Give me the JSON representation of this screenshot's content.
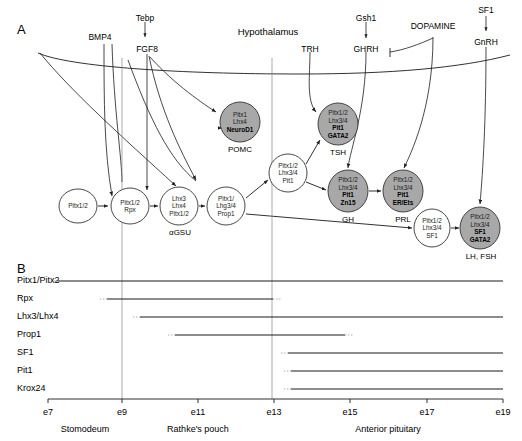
{
  "figure": {
    "panels": [
      {
        "id": "A",
        "letter": "A"
      },
      {
        "id": "B",
        "letter": "B"
      }
    ]
  },
  "panelA": {
    "letter": "A",
    "region_title": "Hypothalamus",
    "signals": [
      {
        "name": "BMP4",
        "x": 100,
        "y": 33
      },
      {
        "name": "Tebp",
        "x": 145,
        "y": 14
      },
      {
        "name": "FGF8",
        "x": 147,
        "y": 45
      },
      {
        "name": "TRH",
        "x": 310,
        "y": 45
      },
      {
        "name": "Gsh1",
        "x": 366,
        "y": 14
      },
      {
        "name": "GHRH",
        "x": 366,
        "y": 45
      },
      {
        "name": "DOPAMINE",
        "x": 433,
        "y": 28
      },
      {
        "name": "SF1",
        "x": 485,
        "y": 8
      },
      {
        "name": "GnRH",
        "x": 486,
        "y": 40
      }
    ],
    "nodes": [
      {
        "id": "pitx12",
        "label_lines": [
          "Pitx1/2"
        ],
        "bold": [],
        "filled": false,
        "cx": 78,
        "cy": 206,
        "rx": 19,
        "ry": 17,
        "caption": ""
      },
      {
        "id": "rpx",
        "label_lines": [
          "Pitx1/2",
          "Rpx"
        ],
        "bold": [],
        "filled": false,
        "cx": 130,
        "cy": 206,
        "rx": 19,
        "ry": 18,
        "caption": ""
      },
      {
        "id": "agsu",
        "label_lines": [
          "Lhx3",
          "Lhx4",
          "Pitx1/2"
        ],
        "bold": [],
        "filled": false,
        "cx": 179,
        "cy": 206,
        "rx": 19,
        "ry": 19,
        "caption": "αGSU"
      },
      {
        "id": "prop1",
        "label_lines": [
          "Pitx1/",
          "Lhg3/4",
          "Prop1"
        ],
        "bold": [],
        "filled": false,
        "cx": 226,
        "cy": 206,
        "rx": 19,
        "ry": 19,
        "caption": ""
      },
      {
        "id": "pomc",
        "label_lines": [
          "Pitx1",
          "Lhx4",
          "NeuroD1"
        ],
        "bold": [
          "NeuroD1"
        ],
        "filled": true,
        "cx": 240,
        "cy": 122,
        "rx": 20,
        "ry": 20,
        "caption": "POMC"
      },
      {
        "id": "pit1",
        "label_lines": [
          "Pitx1/2",
          "Lhx3/4",
          "Pit1"
        ],
        "bold": [],
        "filled": false,
        "cx": 288,
        "cy": 173,
        "rx": 19,
        "ry": 19,
        "caption": ""
      },
      {
        "id": "tsh",
        "label_lines": [
          "Pitx1/2",
          "Lhx3/4",
          "Pit1",
          "GATA2"
        ],
        "bold": [
          "Pit1",
          "GATA2"
        ],
        "filled": true,
        "cx": 338,
        "cy": 124,
        "rx": 20,
        "ry": 21,
        "caption": "TSH"
      },
      {
        "id": "gh",
        "label_lines": [
          "Pitx1/2",
          "Lhx3/4",
          "Pit1",
          "Zn15"
        ],
        "bold": [
          "Pit1",
          "Zn15"
        ],
        "filled": true,
        "cx": 348,
        "cy": 191,
        "rx": 20,
        "ry": 21,
        "caption": "GH"
      },
      {
        "id": "prl",
        "label_lines": [
          "Pitx1/2",
          "Lhx3/4",
          "Pit1",
          "ER/Ets"
        ],
        "bold": [
          "Pit1",
          "ER/Ets"
        ],
        "filled": true,
        "cx": 403,
        "cy": 191,
        "rx": 20,
        "ry": 21,
        "caption": "PRL"
      },
      {
        "id": "sf1w",
        "label_lines": [
          "Pitx1/2",
          "Lhx3/4",
          "SF1"
        ],
        "bold": [],
        "filled": false,
        "cx": 432,
        "cy": 228,
        "rx": 18,
        "ry": 19,
        "caption": ""
      },
      {
        "id": "lhfsh",
        "label_lines": [
          "Pitx1/2",
          "Lhx3/4",
          "SF1",
          "GATA2"
        ],
        "bold": [
          "SF1",
          "GATA2"
        ],
        "filled": true,
        "cx": 480,
        "cy": 228,
        "rx": 20,
        "ry": 21,
        "caption": "LH, FSH"
      }
    ],
    "node_fill_color": "#a8a8a8",
    "node_stroke_color": "#333333"
  },
  "panelB": {
    "letter": "B",
    "genes": [
      {
        "name": "Pitx1/Pitx2",
        "y": 281,
        "start": 58,
        "end": 503,
        "fade_start": true,
        "fade_end": false
      },
      {
        "name": "Rpx",
        "y": 299,
        "start": 107,
        "end": 273,
        "fade_start": true,
        "fade_end": true
      },
      {
        "name": "Lhx3/Lhx4",
        "y": 317,
        "start": 140,
        "end": 503,
        "fade_start": true,
        "fade_end": false
      },
      {
        "name": "Prop1",
        "y": 335,
        "start": 175,
        "end": 345,
        "fade_start": true,
        "fade_end": true
      },
      {
        "name": "SF1",
        "y": 353,
        "start": 288,
        "end": 503,
        "fade_start": true,
        "fade_end": false
      },
      {
        "name": "Pit1",
        "y": 371,
        "start": 291,
        "end": 503,
        "fade_start": true,
        "fade_end": false
      },
      {
        "name": "Krox24",
        "y": 389,
        "start": 291,
        "end": 503,
        "fade_start": true,
        "fade_end": false
      }
    ],
    "axis": {
      "y": 399,
      "x_start": 48,
      "x_end": 503,
      "ticks": [
        {
          "label": "e7",
          "x": 48
        },
        {
          "label": "e9",
          "x": 122
        },
        {
          "label": "e11",
          "x": 198
        },
        {
          "label": "e13",
          "x": 274
        },
        {
          "label": "e15",
          "x": 350
        },
        {
          "label": "e17",
          "x": 427
        },
        {
          "label": "e19",
          "x": 503
        }
      ],
      "stages": [
        {
          "label": "Stomodeum",
          "x": 85
        },
        {
          "label": "Rathke's pouch",
          "x": 198
        },
        {
          "label": "Anterior pituitary",
          "x": 388
        }
      ]
    },
    "guides": [
      122,
      272
    ]
  }
}
